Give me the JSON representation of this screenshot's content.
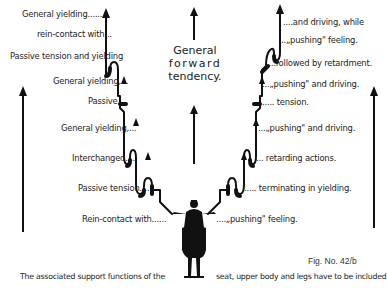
{
  "diagram": {
    "center_title": [
      "General",
      "forward",
      "tendency."
    ],
    "left_labels": [
      {
        "text": "General yielding......",
        "x": 22,
        "y": 10
      },
      {
        "text": "rein-contact with...",
        "x": 37,
        "y": 30
      },
      {
        "text": "Passive tension and yielding",
        "x": 10,
        "y": 52
      },
      {
        "text": "General yielding,...",
        "x": 53,
        "y": 77
      },
      {
        "text": "Passive....",
        "x": 88,
        "y": 97
      },
      {
        "text": "General yielding,...",
        "x": 61,
        "y": 124
      },
      {
        "text": "Interchanged.....",
        "x": 72,
        "y": 154
      },
      {
        "text": "Passive tension.....",
        "x": 78,
        "y": 184
      },
      {
        "text": "Rein-contact with......",
        "x": 82,
        "y": 215
      }
    ],
    "right_labels": [
      {
        "text": "....and driving, while",
        "x": 277,
        "y": 18
      },
      {
        "text": "..„pushing\" feeling.",
        "x": 279,
        "y": 36
      },
      {
        "text": "....followed by retardment.",
        "x": 271,
        "y": 59
      },
      {
        "text": "...„pushing\" and driving.",
        "x": 252,
        "y": 80
      },
      {
        "text": "..... tension.",
        "x": 252,
        "y": 98
      },
      {
        "text": "...„pushing\" and driving.",
        "x": 240,
        "y": 124
      },
      {
        "text": "... retarding actions.",
        "x": 240,
        "y": 154
      },
      {
        "text": "..... terminating in yielding.",
        "x": 234,
        "y": 184
      },
      {
        "text": "....„pushing\" feeling.",
        "x": 216,
        "y": 215
      }
    ],
    "figure_number": "Fig. No. 42/b",
    "footer_left": "The associated support functions of the",
    "footer_right": "seat, upper body and legs have to be included",
    "colors": {
      "ink": "#111111",
      "background": "#ffffff"
    }
  }
}
